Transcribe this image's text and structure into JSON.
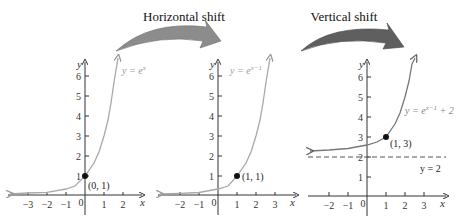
{
  "titles": {
    "horizontal": "Horizontal shift",
    "vertical": "Vertical shift"
  },
  "colors": {
    "arrow_horizontal": "#8c8c8c",
    "arrow_vertical": "#5f5f5f",
    "curve_light": "#a8a8a8",
    "curve_dark": "#777777",
    "axis": "#333333"
  },
  "panels": [
    {
      "equation_prefix": "y = e",
      "equation_sup": "x",
      "equation_suffix": "",
      "point_label": "(0, 1)",
      "x_ticks": [
        "−3",
        "−2",
        "−1",
        "0",
        "1",
        "2"
      ],
      "y_ticks": [
        "1",
        "2",
        "3",
        "4",
        "5",
        "6"
      ],
      "x_axis_label": "x",
      "y_axis_label": "y"
    },
    {
      "equation_prefix": "y = e",
      "equation_sup": "x−1",
      "equation_suffix": "",
      "point_label": "(1, 1)",
      "x_ticks": [
        "−2",
        "−1",
        "0",
        "1",
        "2",
        "3"
      ],
      "y_ticks": [
        "1",
        "2",
        "3",
        "4",
        "5",
        "6"
      ],
      "x_axis_label": "x",
      "y_axis_label": "y"
    },
    {
      "equation_prefix": "y = e",
      "equation_sup": "x−1",
      "equation_suffix": " + 2",
      "point_label": "(1, 3)",
      "asymptote_label": "y = 2",
      "x_ticks": [
        "−2",
        "−1",
        "0",
        "1",
        "2",
        "3"
      ],
      "y_ticks": [
        "1",
        "2",
        "3",
        "4",
        "5",
        "6"
      ],
      "x_axis_label": "x",
      "y_axis_label": "y"
    }
  ]
}
